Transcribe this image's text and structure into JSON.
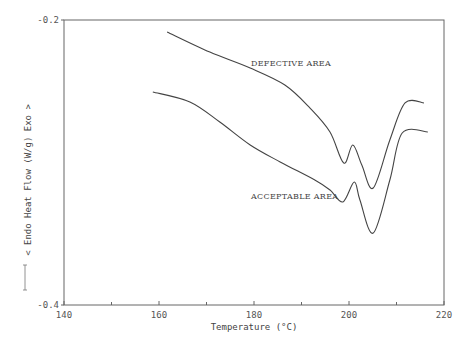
{
  "chart_data": {
    "type": "line",
    "title": "",
    "xlabel": "Temperature (°C)",
    "ylabel": "< Endo   Heat Flow (W/g)   Exo >",
    "xlim": [
      140,
      220
    ],
    "ylim": [
      -0.4,
      -0.2
    ],
    "x_ticks": [
      140,
      160,
      180,
      200,
      220
    ],
    "x_minor_ticks": [
      150,
      170,
      190,
      210
    ],
    "y_ticks": [
      -0.2,
      -0.4
    ],
    "y_tick_labels": [
      "-0.2",
      "-0.4"
    ],
    "grid": false,
    "legend": null,
    "series": [
      {
        "name": "DEFECTIVE AREA",
        "x": [
          161.7,
          170.7,
          179.2,
          186.5,
          191.8,
          196.0,
          198.9,
          200.8,
          202.7,
          205.1,
          208.6,
          211.8,
          215.8
        ],
        "y": [
          -0.2084,
          -0.2225,
          -0.2337,
          -0.2456,
          -0.2618,
          -0.2786,
          -0.3004,
          -0.2877,
          -0.3018,
          -0.3179,
          -0.2842,
          -0.2582,
          -0.2582
        ]
      },
      {
        "name": "ACCEPTABLE AREA",
        "x": [
          158.7,
          166.5,
          172.8,
          179.2,
          185.5,
          192.8,
          196.0,
          198.7,
          201.1,
          202.3,
          205.1,
          208.6,
          211.2,
          216.6
        ],
        "y": [
          -0.2505,
          -0.2575,
          -0.2716,
          -0.2877,
          -0.2996,
          -0.3123,
          -0.3193,
          -0.3277,
          -0.3137,
          -0.3263,
          -0.3495,
          -0.3123,
          -0.2793,
          -0.2786
        ]
      }
    ],
    "annotations": [
      {
        "text": "DEFECTIVE AREA",
        "x": 180,
        "y": -0.232
      },
      {
        "text": "ACCEPTABLE AREA",
        "x": 180,
        "y": -0.3255
      }
    ]
  },
  "labels": {
    "xlabel": "Temperature (°C)",
    "ylabel": "< Endo   Heat Flow (W/g)   Exo >",
    "defective": "DEFECTIVE AREA",
    "acceptable": "ACCEPTABLE AREA"
  }
}
